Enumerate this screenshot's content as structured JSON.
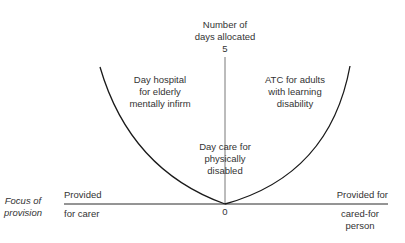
{
  "diagram": {
    "y_axis": {
      "title": "Number of\ndays allocated",
      "max_label": "5",
      "origin_label": "0"
    },
    "x_axis": {
      "title": "Focus of\nprovision",
      "left_top": "Provided",
      "left_bottom": "for carer",
      "right_top": "Provided for",
      "right_bottom": "cared-for\nperson"
    },
    "regions": [
      {
        "label": "Day hospital\nfor elderly\nmentally infirm"
      },
      {
        "label": "ATC for adults\nwith learning\ndisability"
      },
      {
        "label": "Day care for\nphysically\ndisabled"
      }
    ],
    "colors": {
      "line": "#1a1a1a",
      "text": "#333333",
      "background": "#ffffff"
    }
  }
}
